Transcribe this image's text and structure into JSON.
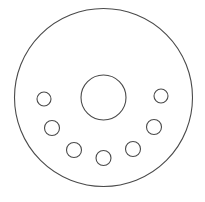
{
  "diagram": {
    "width": 205,
    "height": 202,
    "background": "#ffffff",
    "stroke_color": "#4a4a4a",
    "stroke_width": 1.1,
    "outer_circle": {
      "cx": 103.5,
      "cy": 97.5,
      "r": 89
    },
    "center_circle": {
      "cx": 103.5,
      "cy": 97.5,
      "r": 22.5
    },
    "small_circles": [
      {
        "cx": 44,
        "cy": 99,
        "r": 7
      },
      {
        "cx": 52,
        "cy": 128,
        "r": 7.5
      },
      {
        "cx": 74,
        "cy": 150,
        "r": 7.5
      },
      {
        "cx": 103.5,
        "cy": 158,
        "r": 7.5
      },
      {
        "cx": 133,
        "cy": 149,
        "r": 7.5
      },
      {
        "cx": 154,
        "cy": 127,
        "r": 7.5
      },
      {
        "cx": 161,
        "cy": 96,
        "r": 7
      }
    ]
  }
}
